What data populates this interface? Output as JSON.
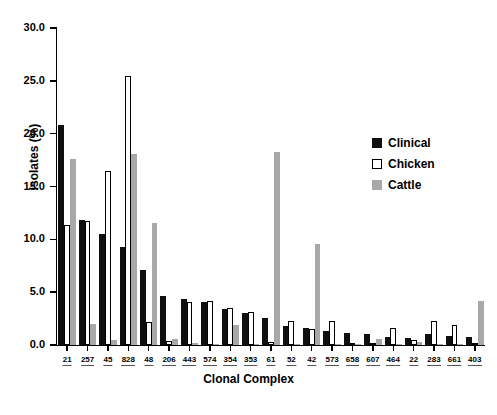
{
  "chart_data": {
    "type": "bar",
    "title": "",
    "xlabel": "Clonal Complex",
    "ylabel": "Isolates (%)",
    "ylim": [
      0,
      30
    ],
    "yticks": [
      "0.0",
      "5.0",
      "10.0",
      "15.0",
      "20.0",
      "25.0",
      "30.0"
    ],
    "ytick_values": [
      0,
      5,
      10,
      15,
      20,
      25,
      30
    ],
    "grid": false,
    "legend_position": "right-center",
    "categories": [
      "21",
      "257",
      "45",
      "828",
      "48",
      "206",
      "443",
      "574",
      "354",
      "353",
      "61",
      "52",
      "42",
      "573",
      "658",
      "607",
      "464",
      "22",
      "283",
      "661",
      "403"
    ],
    "series": [
      {
        "name": "Clinical",
        "color": "#100f0f",
        "values": [
          20.8,
          11.8,
          10.5,
          9.3,
          7.1,
          4.6,
          4.4,
          4.1,
          3.4,
          3.0,
          2.6,
          1.8,
          1.6,
          1.3,
          1.1,
          1.0,
          0.8,
          0.7,
          1.0,
          0.9,
          0.8
        ]
      },
      {
        "name": "Chicken",
        "color": "#ffffff",
        "values": [
          11.4,
          11.7,
          16.5,
          25.5,
          2.2,
          0.4,
          4.1,
          4.2,
          3.5,
          3.1,
          0.3,
          2.3,
          1.5,
          2.3,
          0.2,
          0.1,
          1.6,
          0.5,
          2.3,
          1.9,
          0.1
        ]
      },
      {
        "name": "Cattle",
        "color": "#a8a8a8",
        "values": [
          17.6,
          2.0,
          0.5,
          18.1,
          11.5,
          0.6,
          0.2,
          0.1,
          1.9,
          0.1,
          18.3,
          0.1,
          9.6,
          0.1,
          0.1,
          0.6,
          0.1,
          0.3,
          0.1,
          0.1,
          4.2
        ]
      }
    ]
  },
  "legend": {
    "items": [
      {
        "label": "Clinical",
        "key": "clinical"
      },
      {
        "label": "Chicken",
        "key": "chicken"
      },
      {
        "label": "Cattle",
        "key": "cattle"
      }
    ]
  },
  "axes": {
    "y_title": "Isolates (%)",
    "x_title": "Clonal Complex"
  }
}
